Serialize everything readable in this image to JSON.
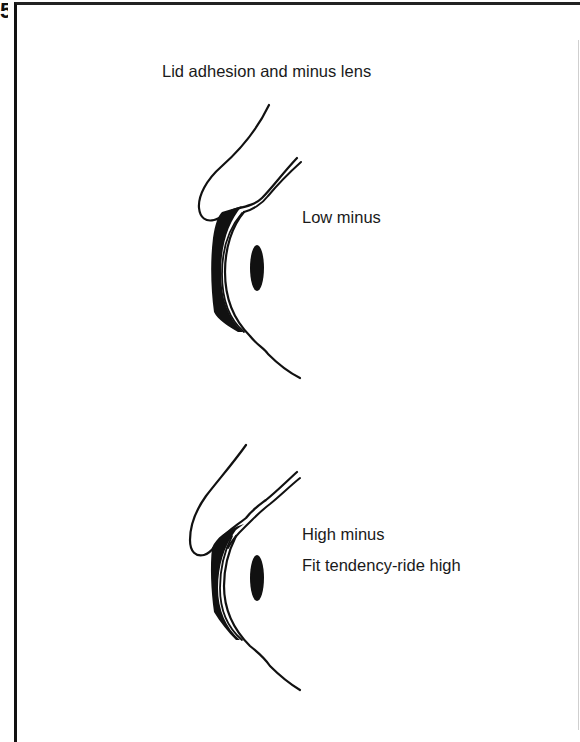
{
  "figure": {
    "label_fragment": "5",
    "title": "Lid adhesion and minus lens",
    "panels": [
      {
        "id": "low-minus",
        "labels": [
          "Low minus"
        ]
      },
      {
        "id": "high-minus",
        "labels": [
          "High minus",
          "Fit tendency-ride high"
        ]
      }
    ]
  },
  "colors": {
    "ink": "#111111",
    "background": "#ffffff"
  }
}
